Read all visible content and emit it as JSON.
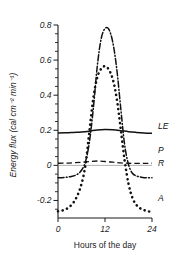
{
  "chart_data": {
    "type": "line",
    "title": "",
    "xlabel": "Hours of the day",
    "ylabel": "Energy flux (cal cm⁻² min⁻¹)",
    "xlim": [
      0,
      24
    ],
    "ylim": [
      -0.3,
      0.8
    ],
    "xticks": [
      0,
      12,
      24
    ],
    "xtick_labels": [
      "0",
      "12",
      "24"
    ],
    "yticks": [
      -0.2,
      0,
      0.2,
      0.4,
      0.6,
      0.8
    ],
    "ytick_labels": [
      "-0.2",
      "0",
      "0.2",
      "0.4",
      "0.6",
      "0.8"
    ],
    "minor_ytick_step": 0.05,
    "grid": false,
    "legend_position": "right-inline-labels",
    "series": [
      {
        "name": "Rn",
        "label": "R",
        "style": "dash-dot",
        "color": "#111111",
        "x": [
          0,
          1,
          2,
          3,
          4,
          5,
          6,
          7,
          8,
          9,
          10,
          11,
          12,
          13,
          14,
          15,
          16,
          17,
          18,
          19,
          20,
          21,
          22,
          23,
          24
        ],
        "values": [
          -0.07,
          -0.07,
          -0.068,
          -0.065,
          -0.06,
          -0.05,
          -0.028,
          0.02,
          0.13,
          0.32,
          0.56,
          0.72,
          0.78,
          0.775,
          0.7,
          0.55,
          0.33,
          0.12,
          0.005,
          -0.045,
          -0.06,
          -0.066,
          -0.07,
          -0.07,
          -0.07
        ]
      },
      {
        "name": "A",
        "label": "A",
        "style": "dotted",
        "color": "#111111",
        "x": [
          0,
          1,
          2,
          3,
          4,
          5,
          6,
          7,
          8,
          9,
          10,
          11,
          12,
          13,
          14,
          15,
          16,
          17,
          18,
          19,
          20,
          21,
          22,
          23,
          24
        ],
        "values": [
          -0.262,
          -0.258,
          -0.25,
          -0.235,
          -0.21,
          -0.17,
          -0.105,
          0.0,
          0.19,
          0.38,
          0.5,
          0.55,
          0.565,
          0.545,
          0.49,
          0.38,
          0.21,
          0.03,
          -0.105,
          -0.185,
          -0.225,
          -0.245,
          -0.255,
          -0.262,
          -0.265
        ]
      },
      {
        "name": "LE",
        "label": "LE",
        "style": "solid",
        "color": "#111111",
        "x": [
          0,
          2,
          4,
          6,
          8,
          10,
          12,
          14,
          16,
          18,
          20,
          22,
          24
        ],
        "values": [
          0.185,
          0.186,
          0.188,
          0.19,
          0.195,
          0.202,
          0.205,
          0.203,
          0.198,
          0.192,
          0.188,
          0.185,
          0.183
        ]
      },
      {
        "name": "P",
        "label": "P",
        "style": "dashed",
        "color": "#111111",
        "x": [
          0,
          2,
          4,
          6,
          8,
          10,
          12,
          14,
          16,
          18,
          20,
          22,
          24
        ],
        "values": [
          0.012,
          0.013,
          0.015,
          0.018,
          0.022,
          0.025,
          0.022,
          0.018,
          0.014,
          0.012,
          0.011,
          0.011,
          0.012
        ]
      }
    ],
    "curve_labels": [
      {
        "text": "LE",
        "x": 24.6,
        "y": 0.225
      },
      {
        "text": "P",
        "x": 24.6,
        "y": 0.085
      },
      {
        "text": "R",
        "x": 24.6,
        "y": 0.015
      },
      {
        "text": "A",
        "x": 24.6,
        "y": -0.185
      }
    ],
    "axis_color": "#1a1a1a"
  }
}
